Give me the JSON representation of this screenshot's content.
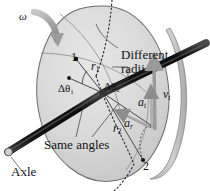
{
  "figure": {
    "background_color": "#ffffff",
    "disk_fill": "#d8d8d8",
    "disk_stroke": "#6e6e6e",
    "axle_color": "#151515",
    "vector_color": "#9a9a9a",
    "text_color": "#141414"
  },
  "labels": {
    "omega": "ω",
    "point1": "1",
    "point2": "2",
    "radius1_base": "r",
    "radius1_sub": "1",
    "radius2_base": "r",
    "radius2_sub": "2",
    "delta_theta1_base": "Δθ",
    "delta_theta1_sub": "1",
    "delta_theta2_base": "Δθ",
    "delta_theta2_sub": "2",
    "different_radii_line1": "Different",
    "different_radii_line2": "radii",
    "same_angles": "Same angles",
    "axle": "Axle",
    "a_tangential_base": "a",
    "a_tangential_sub": "t",
    "a_radial_base": "a",
    "a_radial_sub": "r",
    "v_tangential_base": "v",
    "v_tangential_sub": "t"
  },
  "icons": {
    "rotation_arrow": "curved-arrow-icon",
    "velocity_vector": "arrow-up-icon",
    "tangential_accel_vector": "arrow-up-icon",
    "radial_accel_vector": "arrow-left-icon"
  }
}
